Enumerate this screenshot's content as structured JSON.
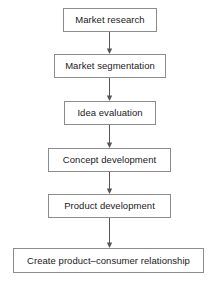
{
  "diagram": {
    "orientation": "vertical",
    "style": {
      "box_border_color": "#8c8c8c",
      "box_fill_color": "#ffffff",
      "text_color": "#1a1a1a",
      "arrow_color": "#555555",
      "background_color": "#ffffff"
    },
    "nodes": [
      {
        "id": "market-research",
        "label": "Market research",
        "x": 63,
        "y": 8,
        "width": 94,
        "height": 24
      },
      {
        "id": "market-segmentation",
        "label": "Market segmentation",
        "x": 54,
        "y": 54,
        "width": 112,
        "height": 24
      },
      {
        "id": "idea-evaluation",
        "label": "Idea evaluation",
        "x": 64,
        "y": 101,
        "width": 92,
        "height": 24
      },
      {
        "id": "concept-development",
        "label": "Concept development",
        "x": 48,
        "y": 148,
        "width": 123,
        "height": 24
      },
      {
        "id": "product-development",
        "label": "Product development",
        "x": 48,
        "y": 194,
        "width": 123,
        "height": 24
      },
      {
        "id": "create-product-consumer-relationship",
        "label": "Create product–consumer relationship",
        "x": 13,
        "y": 248,
        "width": 191,
        "height": 25
      }
    ],
    "connectors": [
      {
        "id": "arrow-1",
        "from": "market-research",
        "to": "market-segmentation",
        "x": 104,
        "y": 32,
        "length": 22
      },
      {
        "id": "arrow-2",
        "from": "market-segmentation",
        "to": "idea-evaluation",
        "x": 104,
        "y": 78,
        "length": 23
      },
      {
        "id": "arrow-3",
        "from": "idea-evaluation",
        "to": "concept-development",
        "x": 104,
        "y": 125,
        "length": 23
      },
      {
        "id": "arrow-4",
        "from": "concept-development",
        "to": "product-development",
        "x": 104,
        "y": 172,
        "length": 22
      },
      {
        "id": "arrow-5",
        "from": "product-development",
        "to": "create-product-consumer-relationship",
        "x": 104,
        "y": 218,
        "length": 30
      }
    ]
  }
}
